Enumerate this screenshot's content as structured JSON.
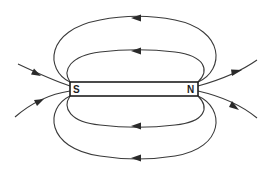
{
  "diagram": {
    "type": "bar-magnet-field-lines",
    "magnet": {
      "left_pole_label": "S",
      "right_pole_label": "N"
    },
    "field_line_direction": "N to S (outside the magnet)",
    "colors": {
      "line": "#3a3a3a",
      "magnet_outline": "#1e1e1e",
      "background": "#ffffff"
    }
  }
}
